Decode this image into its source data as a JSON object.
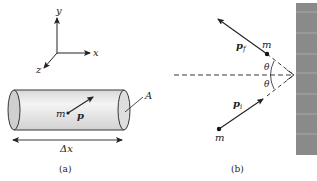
{
  "figure": {
    "panel_a": {
      "caption": "(a)",
      "axes": {
        "x": "x",
        "y": "y",
        "z": "z"
      },
      "particle_mass": "m",
      "momentum": "p",
      "area": "A",
      "length": "Δx"
    },
    "panel_b": {
      "caption": "(b)",
      "mass_final": "m",
      "mass_initial": "m",
      "momentum_final": "p",
      "momentum_final_sub": "f",
      "momentum_initial": "p",
      "momentum_initial_sub": "i",
      "angle_top": "θ",
      "angle_bottom": "θ"
    },
    "colors": {
      "wall": "#8a8a8a",
      "wall_line": "#b0b0b0",
      "cylinder_fill": "#e6e6e6",
      "stroke": "#222222"
    }
  }
}
